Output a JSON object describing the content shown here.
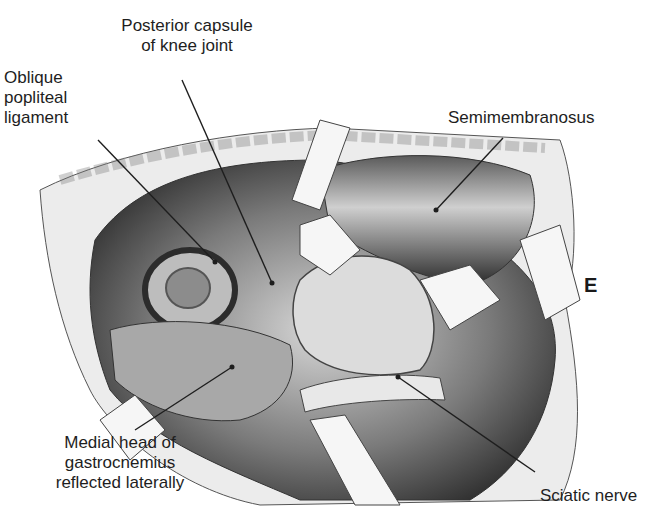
{
  "figure": {
    "panel_letter": "E",
    "labels": {
      "posterior_capsule": [
        "Posterior capsule",
        "of knee joint"
      ],
      "oblique_popliteal": [
        "Oblique",
        "popliteal",
        "ligament"
      ],
      "semimembranosus": [
        "Semimembranosus"
      ],
      "medial_head": [
        "Medial head of",
        "gastrocnemius",
        "reflected laterally"
      ],
      "sciatic_nerve": [
        "Sciatic nerve"
      ]
    },
    "colors": {
      "background": "#ffffff",
      "ink": "#1e1e1e",
      "dark_tissue": "#3a3a3a",
      "mid_tissue": "#8a8a8a",
      "light_tissue": "#d9d9d9",
      "retractor": "#f4f4f4"
    }
  }
}
